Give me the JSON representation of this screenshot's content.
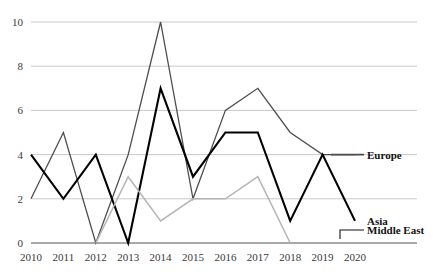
{
  "chart_data": {
    "type": "line",
    "title": "",
    "xlabel": "",
    "ylabel": "",
    "categories": [
      "2010",
      "2011",
      "2012",
      "2013",
      "2014",
      "2015",
      "2016",
      "2017",
      "2018",
      "2019",
      "2020"
    ],
    "x": [
      2010,
      2011,
      2012,
      2013,
      2014,
      2015,
      2016,
      2017,
      2018,
      2019,
      2020
    ],
    "ylim": [
      0,
      10
    ],
    "xlim": [
      2010,
      2020
    ],
    "yticks": [
      0,
      2,
      4,
      6,
      8,
      10
    ],
    "ytick_labels": [
      "0",
      "2",
      "4",
      "6",
      "8",
      "10"
    ],
    "xtick_labels": [
      "2010",
      "2011",
      "2012",
      "2013",
      "2014",
      "2015",
      "2016",
      "2017",
      "2018",
      "2019",
      "2020"
    ],
    "grid": true,
    "grid_axis": "y",
    "legend_position": "inline-right",
    "series": [
      {
        "name": "Europe",
        "color": "#4d4d4d",
        "width": 1.3,
        "values": [
          2,
          5,
          0,
          4,
          10,
          2,
          6,
          7,
          5,
          4,
          4
        ],
        "label_value": 4
      },
      {
        "name": "Asia",
        "color": "#000000",
        "width": 2.1,
        "values": [
          4,
          2,
          4,
          0,
          7,
          3,
          5,
          5,
          1,
          4,
          1
        ],
        "label_value": 1
      },
      {
        "name": "Middle East",
        "color": "#b5b5b5",
        "width": 1.5,
        "values": [
          null,
          null,
          0,
          3,
          1,
          2,
          2,
          3,
          0,
          null,
          null
        ],
        "label_value": 0
      }
    ]
  },
  "legend": {
    "items": [
      {
        "label": "Europe",
        "color": "#4d4d4d"
      },
      {
        "label": "Asia",
        "color": "#000000"
      },
      {
        "label": "Middle East",
        "color": "#000000"
      }
    ]
  },
  "axes": {
    "y_title": "",
    "x_title": ""
  }
}
